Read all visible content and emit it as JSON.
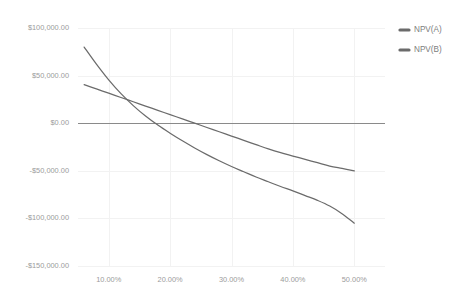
{
  "chart_data": {
    "type": "line",
    "title": "",
    "subtitle": "",
    "xlabel": "",
    "ylabel": "",
    "xlim": [
      0.05,
      0.55
    ],
    "ylim": [
      -150000,
      100000
    ],
    "grid": true,
    "legend_position": "right",
    "x": [
      0.06,
      0.08,
      0.1,
      0.12,
      0.14,
      0.16,
      0.18,
      0.2,
      0.22,
      0.24,
      0.26,
      0.28,
      0.3,
      0.32,
      0.34,
      0.36,
      0.38,
      0.4,
      0.42,
      0.44,
      0.46,
      0.48,
      0.5
    ],
    "x_tick_values": [
      0.1,
      0.2,
      0.3,
      0.4,
      0.5
    ],
    "x_tick_labels": [
      "10.00%",
      "20.00%",
      "30.00%",
      "40.00%",
      "50.00%"
    ],
    "y_tick_values": [
      100000,
      50000,
      0,
      -50000,
      -100000,
      -150000
    ],
    "y_tick_labels": [
      "$100,000.00",
      "$50,000.00",
      "$0.00",
      "-$50,000.00",
      "-$100,000.00",
      "-$150,000.00"
    ],
    "series": [
      {
        "name": "NPV(A)",
        "color": "#6b6b6b",
        "values": [
          80000,
          62000,
          45500,
          31000,
          18500,
          7500,
          -2000,
          -10500,
          -18500,
          -26000,
          -33000,
          -39500,
          -45500,
          -51000,
          -56500,
          -61500,
          -66500,
          -71000,
          -76000,
          -81000,
          -87000,
          -95000,
          -105000
        ]
      },
      {
        "name": "NPV(B)",
        "color": "#6b6b6b",
        "values": [
          40500,
          36000,
          31500,
          27000,
          22500,
          18000,
          13500,
          9000,
          4500,
          0,
          -4500,
          -9000,
          -13500,
          -18000,
          -22500,
          -27000,
          -31000,
          -34500,
          -38000,
          -41500,
          -45000,
          -47500,
          -50000
        ]
      }
    ],
    "annotations": []
  },
  "legend": {
    "entries": [
      {
        "label": "NPV(A)",
        "color": "#6b6b6b"
      },
      {
        "label": "NPV(B)",
        "color": "#6b6b6b"
      }
    ]
  },
  "colors": {
    "background": "#ffffff",
    "grid": "#f2f2f2",
    "zero_axis": "#8a8a8a",
    "tick_text": "#9b9b9b",
    "legend_text": "#7d7d7d",
    "series_a": "#6b6b6b",
    "series_b": "#6b6b6b"
  }
}
